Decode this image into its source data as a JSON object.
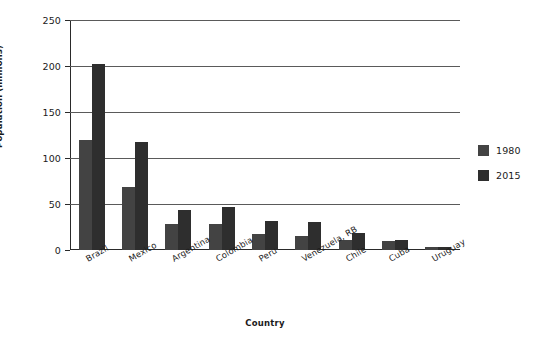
{
  "chart_data": {
    "type": "bar",
    "title": "",
    "xlabel": "Country",
    "ylabel": "Population (millions)",
    "ylim": [
      0,
      250
    ],
    "yticks": [
      0,
      50,
      100,
      150,
      200,
      250
    ],
    "ytick_labels": [
      "0",
      "50",
      "100",
      "150",
      "200",
      "250"
    ],
    "grid": true,
    "legend_position": "right",
    "categories": [
      "Brazil",
      "Mexico",
      "Argentina",
      "Colombia",
      "Peru",
      "Venezuela, RB",
      "Chile",
      "Cuba",
      "Uruguay"
    ],
    "series": [
      {
        "name": "1980",
        "color": "#434343",
        "values": [
          120,
          68,
          28,
          28,
          17,
          15,
          11,
          10,
          3
        ]
      },
      {
        "name": "2015",
        "color": "#2e2e2e",
        "values": [
          202,
          117,
          43,
          47,
          31,
          30,
          18,
          11,
          3
        ]
      }
    ]
  },
  "legend": {
    "entries": [
      {
        "label": "1980"
      },
      {
        "label": "2015"
      }
    ]
  },
  "colors": {
    "series_1980": "#434343",
    "series_2015": "#2e2e2e",
    "gridline": "#5a5a5a",
    "axis": "#2a2a2a",
    "background": "#ffffff",
    "text": "#1a1a1a"
  }
}
